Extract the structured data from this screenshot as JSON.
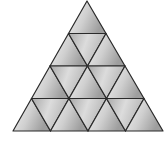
{
  "figure": {
    "rows": 4,
    "small_triangle_count": 16,
    "apex": [
      87,
      1
    ],
    "bottom_left": [
      13,
      131
    ],
    "bottom_right": [
      163,
      131
    ],
    "colors": {
      "stroke": "#2a2a2a",
      "fill_light": "#f2f2f2",
      "fill_mid": "#c8c8c8",
      "fill_dark": "#9a9a9a",
      "background": "#ffffff"
    }
  }
}
